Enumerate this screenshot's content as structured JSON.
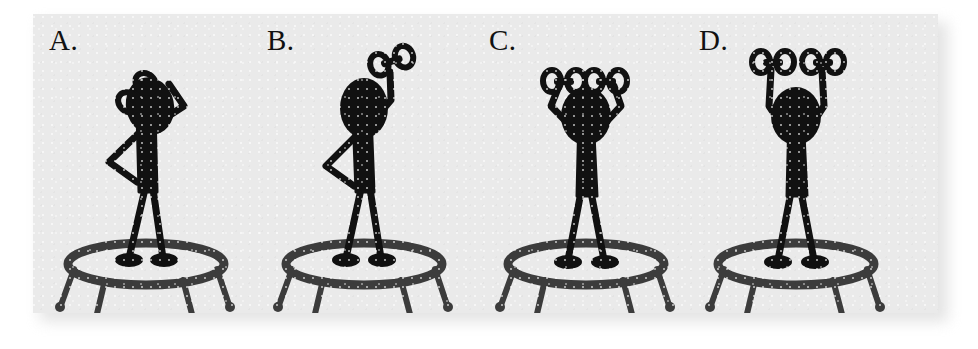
{
  "figure": {
    "panel_background": "#eaeaea",
    "ink_color": "#111111",
    "page_background": "#ffffff",
    "panel_count": 4,
    "caption": ""
  },
  "panels": [
    {
      "label": "A.",
      "letter": "A",
      "pose_name": "dumbbell-at-shoulder-rack-position",
      "description": "Stick figure standing on a mini-trampoline, one dumbbell racked at shoulder height beside the head, elbow bent and pointing back, other hand on hip.",
      "arms_raised": 0,
      "dumbbell_count": 1,
      "dumbbell_height_label": "shoulder",
      "equipment": "mini-trampoline",
      "body_facing": "three-quarter-left"
    },
    {
      "label": "B.",
      "letter": "B",
      "pose_name": "single-arm-overhead-press-lockout",
      "description": "Stick figure standing on a mini-trampoline, one arm extended overhead pressing a single dumbbell, other hand on hip.",
      "arms_raised": 1,
      "dumbbell_count": 1,
      "dumbbell_height_label": "overhead",
      "equipment": "mini-trampoline",
      "body_facing": "three-quarter-left"
    },
    {
      "label": "C.",
      "letter": "C",
      "pose_name": "two-dumbbells-racked-at-head",
      "description": "Stick figure facing forward on a mini-trampoline, both elbows bent with two dumbbells held close together just above the head.",
      "arms_raised": 0,
      "dumbbell_count": 2,
      "dumbbell_height_label": "head",
      "equipment": "mini-trampoline",
      "body_facing": "front"
    },
    {
      "label": "D.",
      "letter": "D",
      "pose_name": "two-dumbbell-overhead-press-lockout",
      "description": "Stick figure facing forward on a mini-trampoline, both arms fully extended overhead with two separated dumbbells.",
      "arms_raised": 2,
      "dumbbell_count": 2,
      "dumbbell_height_label": "overhead",
      "equipment": "mini-trampoline",
      "body_facing": "front"
    }
  ],
  "trampoline": {
    "name": "mini-trampoline",
    "leg_count": 5,
    "frame_shape": "ellipse-ring"
  }
}
